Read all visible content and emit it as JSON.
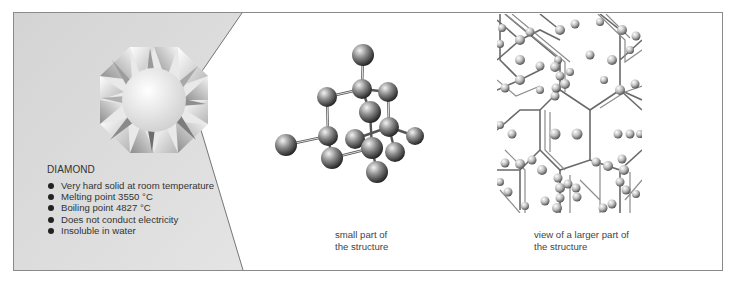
{
  "left_panel": {
    "title": "DIAMOND",
    "properties": [
      "Very hard solid at room temperature",
      "Melting point 3550 °C",
      "Boiling point 4827 °C",
      "Does not conduct electricity",
      "Insoluble in water"
    ],
    "image": "diamond-gem-icon",
    "background_color": "#d8d8d8"
  },
  "middle_panel": {
    "image": "carbon-atoms-small-structure",
    "caption_line1": "small part of",
    "caption_line2": "the structure"
  },
  "right_panel": {
    "image": "diamond-lattice-large-structure",
    "caption_line1": "view of a larger part of",
    "caption_line2": "the structure"
  }
}
